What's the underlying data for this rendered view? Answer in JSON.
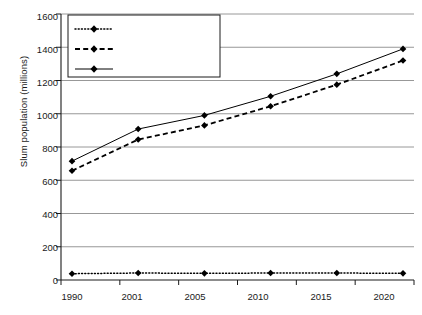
{
  "chart_data": {
    "type": "line",
    "title": "",
    "xlabel": "",
    "ylabel": "Slum population (millions)",
    "categories": [
      "1990",
      "2001",
      "2005",
      "2010",
      "2015",
      "2020"
    ],
    "ylim": [
      0,
      1600
    ],
    "ytick_step": 200,
    "yticks": [
      "0",
      "200",
      "400",
      "600",
      "800",
      "1000",
      "1200",
      "1400",
      "1600"
    ],
    "grid": "horizontal",
    "legend_position": "top-left-inside",
    "series": [
      {
        "name": "Developed regions",
        "line_style": "dotted",
        "marker": "diamond",
        "color": "#000000",
        "values": [
          38,
          42,
          40,
          42,
          42,
          40
        ]
      },
      {
        "name": "Developing regions",
        "line_style": "dashed",
        "marker": "diamond",
        "color": "#000000",
        "values": [
          657,
          845,
          930,
          1045,
          1175,
          1320
        ]
      },
      {
        "name": "World",
        "line_style": "solid",
        "marker": "diamond",
        "color": "#000000",
        "values": [
          715,
          908,
          990,
          1105,
          1240,
          1390
        ]
      }
    ]
  },
  "legend": {
    "items": [
      {
        "label": "Developed regions"
      },
      {
        "label": "Developing regions"
      },
      {
        "label": "World"
      }
    ]
  },
  "colors": {
    "axis": "#1a1a1a",
    "grid": "#8c8c8c",
    "series": "#000000",
    "background": "#ffffff"
  }
}
